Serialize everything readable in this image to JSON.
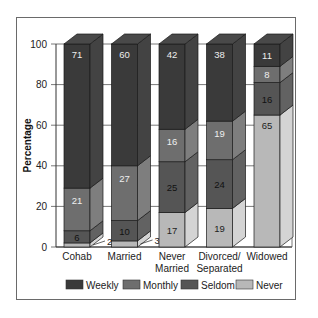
{
  "chart_data": {
    "type": "bar",
    "stacked": true,
    "style": "3d",
    "title": "",
    "xlabel": "",
    "ylabel": "Percentage",
    "ylim": [
      0,
      100
    ],
    "yticks": [
      0,
      20,
      40,
      60,
      80,
      100
    ],
    "grid": true,
    "legend_position": "bottom",
    "categories": [
      "Cohab",
      "Married",
      "Never Married",
      "Divorced/ Separated",
      "Widowed"
    ],
    "category_lines": [
      [
        "Cohab"
      ],
      [
        "Married"
      ],
      [
        "Never",
        "Married"
      ],
      [
        "Divorced/",
        "Separated"
      ],
      [
        "Widowed"
      ]
    ],
    "series": [
      {
        "name": "Never",
        "values": [
          2,
          3,
          17,
          19,
          65
        ],
        "color": "#b8b8b8"
      },
      {
        "name": "Seldom",
        "values": [
          6,
          10,
          25,
          24,
          16
        ],
        "color": "#555555"
      },
      {
        "name": "Monthly",
        "values": [
          21,
          27,
          16,
          19,
          8
        ],
        "color": "#6e6e6e"
      },
      {
        "name": "Weekly",
        "values": [
          71,
          60,
          42,
          38,
          11
        ],
        "color": "#3a3a3a"
      }
    ],
    "legend": [
      "Weekly",
      "Monthly",
      "Seldom",
      "Never"
    ]
  },
  "colors": {
    "weekly": "#3a3a3a",
    "monthly": "#6e6e6e",
    "seldom": "#555555",
    "never": "#b8b8b8"
  }
}
